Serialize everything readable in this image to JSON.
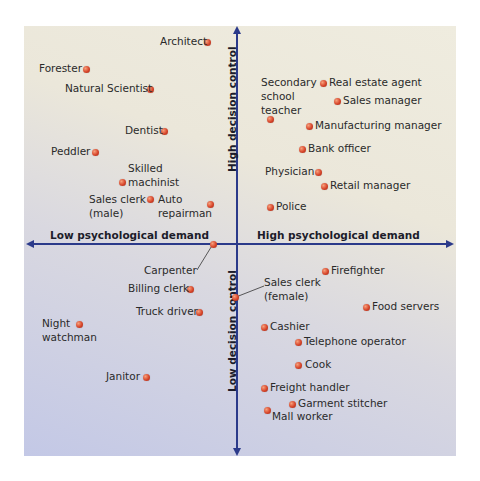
{
  "chart_data": {
    "type": "scatter",
    "title": "",
    "xlabel_left": "Low psychological demand",
    "xlabel_right": "High psychological demand",
    "ylabel_top": "High decision control",
    "ylabel_bottom": "Low decision control",
    "axes": {
      "origin_px": [
        237,
        244
      ],
      "x_range_px": [
        28,
        452
      ],
      "y_range_px": [
        28,
        454
      ],
      "grid": false,
      "ticks": false
    },
    "colors": {
      "axis": "#2b3a8a",
      "dot": "#d7452a",
      "bg_top": "#efecdf",
      "bg_bottom": "#c3c8e6",
      "text": "#2a2a2a"
    },
    "points": [
      {
        "name": "Architect",
        "x": 207,
        "y": 42,
        "quadrant": "low-demand/high-control"
      },
      {
        "name": "Forester",
        "x": 86,
        "y": 69,
        "quadrant": "low-demand/high-control"
      },
      {
        "name": "Natural Scientist",
        "x": 150,
        "y": 89,
        "quadrant": "low-demand/high-control"
      },
      {
        "name": "Dentist",
        "x": 164,
        "y": 131,
        "quadrant": "low-demand/high-control"
      },
      {
        "name": "Peddler",
        "x": 95,
        "y": 152,
        "quadrant": "low-demand/high-control"
      },
      {
        "name": "Skilled machinist",
        "x": 122,
        "y": 182,
        "quadrant": "low-demand/high-control"
      },
      {
        "name": "Sales clerk (male)",
        "x": 150,
        "y": 199,
        "quadrant": "low-demand/high-control"
      },
      {
        "name": "Auto repairman",
        "x": 210,
        "y": 204,
        "quadrant": "low-demand/high-control"
      },
      {
        "name": "Secondary school teacher",
        "x": 270,
        "y": 119,
        "quadrant": "high-demand/high-control"
      },
      {
        "name": "Real estate agent",
        "x": 323,
        "y": 83,
        "quadrant": "high-demand/high-control"
      },
      {
        "name": "Sales manager",
        "x": 337,
        "y": 101,
        "quadrant": "high-demand/high-control"
      },
      {
        "name": "Manufacturing manager",
        "x": 309,
        "y": 126,
        "quadrant": "high-demand/high-control"
      },
      {
        "name": "Bank officer",
        "x": 302,
        "y": 149,
        "quadrant": "high-demand/high-control"
      },
      {
        "name": "Physician",
        "x": 318,
        "y": 172,
        "quadrant": "high-demand/high-control"
      },
      {
        "name": "Retail manager",
        "x": 324,
        "y": 186,
        "quadrant": "high-demand/high-control"
      },
      {
        "name": "Police",
        "x": 270,
        "y": 207,
        "quadrant": "high-demand/high-control"
      },
      {
        "name": "Carpenter",
        "x": 213,
        "y": 244,
        "quadrant": "axis"
      },
      {
        "name": "Billing clerk",
        "x": 190,
        "y": 289,
        "quadrant": "low-demand/low-control"
      },
      {
        "name": "Truck driver",
        "x": 199,
        "y": 312,
        "quadrant": "low-demand/low-control"
      },
      {
        "name": "Night watchman",
        "x": 79,
        "y": 324,
        "quadrant": "low-demand/low-control"
      },
      {
        "name": "Janitor",
        "x": 146,
        "y": 377,
        "quadrant": "low-demand/low-control"
      },
      {
        "name": "Sales clerk (female)",
        "x": 235,
        "y": 297,
        "quadrant": "axis"
      },
      {
        "name": "Firefighter",
        "x": 325,
        "y": 271,
        "quadrant": "high-demand/low-control"
      },
      {
        "name": "Food servers",
        "x": 366,
        "y": 307,
        "quadrant": "high-demand/low-control"
      },
      {
        "name": "Cashier",
        "x": 264,
        "y": 327,
        "quadrant": "high-demand/low-control"
      },
      {
        "name": "Telephone operator",
        "x": 298,
        "y": 342,
        "quadrant": "high-demand/low-control"
      },
      {
        "name": "Cook",
        "x": 298,
        "y": 365,
        "quadrant": "high-demand/low-control"
      },
      {
        "name": "Freight handler",
        "x": 264,
        "y": 388,
        "quadrant": "high-demand/low-control"
      },
      {
        "name": "Garment stitcher",
        "x": 292,
        "y": 404,
        "quadrant": "high-demand/low-control"
      },
      {
        "name": "Mall worker",
        "x": 267,
        "y": 410,
        "quadrant": "high-demand/low-control"
      }
    ]
  },
  "labels": [
    {
      "text": "Architect",
      "x": 160,
      "y": 35,
      "align": "right",
      "w": 40
    },
    {
      "text": "Forester",
      "x": 39,
      "y": 62
    },
    {
      "text": "Natural Scientist",
      "x": 65,
      "y": 82
    },
    {
      "text": "Dentist",
      "x": 125,
      "y": 124
    },
    {
      "text": "Peddler",
      "x": 51,
      "y": 145
    },
    {
      "text": "Skilled",
      "x": 128,
      "y": 162
    },
    {
      "text": "machinist",
      "x": 128,
      "y": 176
    },
    {
      "text": "Sales clerk",
      "x": 89,
      "y": 193
    },
    {
      "text": "(male)",
      "x": 89,
      "y": 207
    },
    {
      "text": "Auto",
      "x": 158,
      "y": 193
    },
    {
      "text": "repairman",
      "x": 158,
      "y": 207
    },
    {
      "text": "Secondary",
      "x": 261,
      "y": 76
    },
    {
      "text": "school",
      "x": 261,
      "y": 90
    },
    {
      "text": "teacher",
      "x": 261,
      "y": 104
    },
    {
      "text": "Real estate agent",
      "x": 329,
      "y": 76
    },
    {
      "text": "Sales manager",
      "x": 343,
      "y": 94
    },
    {
      "text": "Manufacturing manager",
      "x": 315,
      "y": 119
    },
    {
      "text": "Bank officer",
      "x": 308,
      "y": 142
    },
    {
      "text": "Physician",
      "x": 265,
      "y": 165
    },
    {
      "text": "Retail manager",
      "x": 330,
      "y": 179
    },
    {
      "text": "Police",
      "x": 276,
      "y": 200
    },
    {
      "text": "Carpenter",
      "x": 144,
      "y": 264
    },
    {
      "text": "Billing clerk",
      "x": 128,
      "y": 282
    },
    {
      "text": "Truck driver",
      "x": 136,
      "y": 305
    },
    {
      "text": "Night",
      "x": 42,
      "y": 317
    },
    {
      "text": "watchman",
      "x": 42,
      "y": 331
    },
    {
      "text": "Janitor",
      "x": 106,
      "y": 370
    },
    {
      "text": "Sales clerk",
      "x": 264,
      "y": 276
    },
    {
      "text": "(female)",
      "x": 264,
      "y": 290
    },
    {
      "text": "Firefighter",
      "x": 331,
      "y": 264
    },
    {
      "text": "Food servers",
      "x": 372,
      "y": 300
    },
    {
      "text": "Cashier",
      "x": 270,
      "y": 320
    },
    {
      "text": "Telephone operator",
      "x": 304,
      "y": 335
    },
    {
      "text": "Cook",
      "x": 305,
      "y": 358
    },
    {
      "text": "Freight handler",
      "x": 270,
      "y": 381
    },
    {
      "text": "Garment stitcher",
      "x": 298,
      "y": 397
    },
    {
      "text": "Mall worker",
      "x": 272,
      "y": 410
    }
  ],
  "leaders": [
    {
      "from": [
        213,
        244
      ],
      "to": [
        197,
        270
      ]
    },
    {
      "from": [
        236,
        297
      ],
      "to": [
        264,
        286
      ]
    }
  ],
  "axis_labels": {
    "left": "Low psychological demand",
    "right": "High psychological demand",
    "top": "High decision control",
    "bottom": "Low decision control"
  }
}
